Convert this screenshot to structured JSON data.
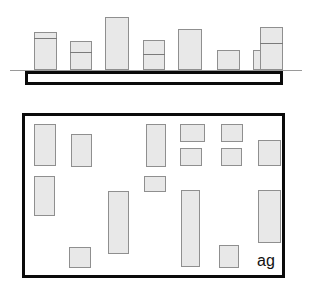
{
  "figure": {
    "width": 309,
    "height": 289,
    "background_color": "#ffffff",
    "label": "ag",
    "stroke_color": "#0a0a0a",
    "fill_color": "#e8e8e8",
    "outline_color": "#8f8f8f",
    "ground_color": "#9a9a9a"
  },
  "chart_data": {
    "type": "bar",
    "title": "",
    "subtitle": "",
    "xlabel": "",
    "ylabel": "",
    "grid": false,
    "legend": "none",
    "xlim": [
      0,
      309
    ],
    "ylim": [
      0,
      70
    ],
    "baseline_y": 70,
    "categories": [
      "1",
      "2",
      "3",
      "4",
      "5",
      "6",
      "7",
      "8"
    ],
    "values": [
      38,
      29,
      53,
      30,
      41,
      20,
      20,
      43
    ],
    "series": [
      {
        "name": "elevation-blocks",
        "values": [
          38,
          29,
          53,
          30,
          41,
          20,
          20,
          43
        ]
      }
    ],
    "bars": [
      {
        "index": 1,
        "x": 34,
        "width": 23,
        "top": 32,
        "height": 38,
        "divider_offset": 6
      },
      {
        "index": 2,
        "x": 70,
        "width": 22,
        "top": 41,
        "height": 29,
        "divider_offset": 11
      },
      {
        "index": 3,
        "x": 105,
        "width": 24,
        "top": 17,
        "height": 53,
        "divider_offset": null
      },
      {
        "index": 4,
        "x": 143,
        "width": 22,
        "top": 40,
        "height": 30,
        "divider_offset": 14
      },
      {
        "index": 5,
        "x": 178,
        "width": 24,
        "top": 29,
        "height": 41,
        "divider_offset": null
      },
      {
        "index": 6,
        "x": 217,
        "width": 23,
        "top": 50,
        "height": 20,
        "divider_offset": null
      },
      {
        "index": 7,
        "x": 253,
        "width": 22,
        "top": 50,
        "height": 20,
        "divider_offset": null
      },
      {
        "index": 8,
        "x": 260,
        "width": 23,
        "top": 27,
        "height": 43,
        "divider_offset": 16
      }
    ],
    "ground_line": {
      "x": 10,
      "y": 70,
      "width": 292
    },
    "slab": {
      "x": 25,
      "y": 71,
      "width": 258,
      "height": 14
    }
  },
  "plan": {
    "type": "floor-plan",
    "frame": {
      "x": 22,
      "y": 113,
      "width": 263,
      "height": 165
    },
    "rooms": [
      {
        "id": "r01",
        "x": 34,
        "y": 124,
        "width": 22,
        "height": 42
      },
      {
        "id": "r02",
        "x": 71,
        "y": 134,
        "width": 21,
        "height": 33
      },
      {
        "id": "r03",
        "x": 146,
        "y": 124,
        "width": 20,
        "height": 43
      },
      {
        "id": "r04",
        "x": 180,
        "y": 124,
        "width": 25,
        "height": 18
      },
      {
        "id": "r05",
        "x": 221,
        "y": 124,
        "width": 22,
        "height": 18
      },
      {
        "id": "r06",
        "x": 180,
        "y": 148,
        "width": 22,
        "height": 18
      },
      {
        "id": "r07",
        "x": 221,
        "y": 148,
        "width": 21,
        "height": 18
      },
      {
        "id": "r08",
        "x": 258,
        "y": 140,
        "width": 23,
        "height": 26
      },
      {
        "id": "r09",
        "x": 34,
        "y": 176,
        "width": 21,
        "height": 40
      },
      {
        "id": "r10",
        "x": 144,
        "y": 176,
        "width": 22,
        "height": 16
      },
      {
        "id": "r11",
        "x": 108,
        "y": 191,
        "width": 21,
        "height": 63
      },
      {
        "id": "r12",
        "x": 181,
        "y": 190,
        "width": 19,
        "height": 77
      },
      {
        "id": "r13",
        "x": 258,
        "y": 190,
        "width": 23,
        "height": 53
      },
      {
        "id": "r14",
        "x": 69,
        "y": 247,
        "width": 22,
        "height": 21
      },
      {
        "id": "r15",
        "x": 219,
        "y": 245,
        "width": 20,
        "height": 23
      }
    ],
    "label": {
      "text": "ag",
      "x": 257,
      "y": 253,
      "font_size": 16
    }
  }
}
